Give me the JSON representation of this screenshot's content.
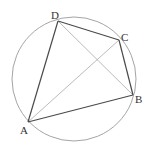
{
  "diagram": {
    "type": "geometry",
    "circle": {
      "cx": 74,
      "cy": 79,
      "r": 62,
      "stroke": "#9a9a9a"
    },
    "points": [
      {
        "id": "A",
        "label": "A",
        "x": 28,
        "y": 122,
        "label_x": 20,
        "label_y": 134
      },
      {
        "id": "B",
        "label": "B",
        "x": 133,
        "y": 95,
        "label_x": 135,
        "label_y": 103
      },
      {
        "id": "C",
        "label": "C",
        "x": 119,
        "y": 40,
        "label_x": 121,
        "label_y": 41
      },
      {
        "id": "D",
        "label": "D",
        "x": 58,
        "y": 21,
        "label_x": 51,
        "label_y": 19
      }
    ],
    "sides": [
      {
        "from": "A",
        "to": "B"
      },
      {
        "from": "B",
        "to": "C"
      },
      {
        "from": "C",
        "to": "D"
      },
      {
        "from": "D",
        "to": "A"
      }
    ],
    "diagonals": [
      {
        "from": "A",
        "to": "C"
      },
      {
        "from": "D",
        "to": "B"
      }
    ],
    "colors": {
      "side": "#4a4a4a",
      "diagonal": "#a8a8a8",
      "circle": "#9a9a9a",
      "label": "#333333"
    }
  }
}
